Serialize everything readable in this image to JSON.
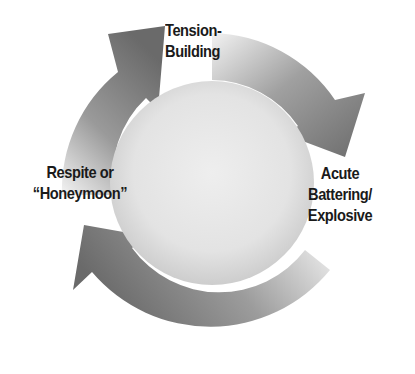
{
  "diagram": {
    "type": "cycle",
    "colors": {
      "arrow_dark": "#6e6e6e",
      "arrow_light": "#e8e8e8",
      "inner_circle_center": "#ececec",
      "inner_circle_edge": "#cfcfcf",
      "text": "#1a1a1a",
      "background": "#ffffff"
    },
    "stages": [
      {
        "id": "tension",
        "lines": [
          "Tension-",
          "Building"
        ]
      },
      {
        "id": "acute",
        "lines": [
          "Acute",
          "Battering/",
          "Explosive"
        ]
      },
      {
        "id": "respite",
        "lines": [
          "Respite or",
          "“Honeymoon”"
        ]
      }
    ],
    "arrows": [
      {
        "from": "Respite or “Honeymoon”",
        "to": "Tension-Building"
      },
      {
        "from": "Tension-Building",
        "to": "Acute Battering/Explosive"
      },
      {
        "from": "Acute Battering/Explosive",
        "to": "Respite or “Honeymoon”"
      }
    ]
  }
}
